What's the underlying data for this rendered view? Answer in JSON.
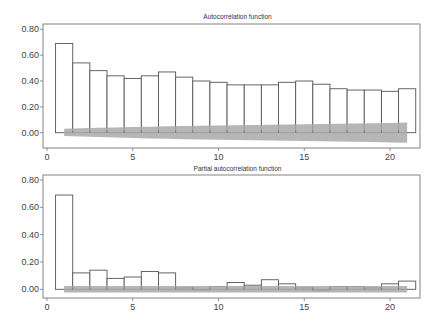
{
  "chart_data": [
    {
      "type": "bar",
      "title": "Autocorrelation function",
      "xlabel": "",
      "ylabel": "",
      "x": [
        1,
        2,
        3,
        4,
        5,
        6,
        7,
        8,
        9,
        10,
        11,
        12,
        13,
        14,
        15,
        16,
        17,
        18,
        19,
        20,
        21
      ],
      "values": [
        0.69,
        0.54,
        0.48,
        0.44,
        0.42,
        0.44,
        0.47,
        0.43,
        0.4,
        0.39,
        0.37,
        0.37,
        0.37,
        0.39,
        0.4,
        0.375,
        0.34,
        0.33,
        0.33,
        0.32,
        0.34,
        0.36
      ],
      "confidence_band": {
        "upper": [
          0.03,
          0.034,
          0.038,
          0.041,
          0.044,
          0.047,
          0.05,
          0.052,
          0.054,
          0.056,
          0.058,
          0.06,
          0.062,
          0.064,
          0.066,
          0.068,
          0.07,
          0.072,
          0.074,
          0.076,
          0.078
        ],
        "lower": [
          -0.025,
          -0.03,
          -0.034,
          -0.038,
          -0.041,
          -0.044,
          -0.047,
          -0.05,
          -0.052,
          -0.054,
          -0.056,
          -0.058,
          -0.06,
          -0.062,
          -0.064,
          -0.066,
          -0.068,
          -0.07,
          -0.072,
          -0.075,
          -0.078
        ]
      },
      "xticks": [
        "0",
        "5",
        "10",
        "15",
        "20"
      ],
      "xtick_values": [
        0,
        5,
        10,
        15,
        20
      ],
      "yticks": [
        "0.00",
        "0.20",
        "0.40",
        "0.60",
        "0.80"
      ],
      "ytick_values": [
        0,
        0.2,
        0.4,
        0.6,
        0.8
      ],
      "xlim": [
        -0.25,
        21.8
      ],
      "ylim": [
        -0.13,
        0.84
      ],
      "grid": false,
      "legend": null
    },
    {
      "type": "bar",
      "title": "Partial autocorrelation function",
      "xlabel": "",
      "ylabel": "",
      "x": [
        1,
        2,
        3,
        4,
        5,
        6,
        7,
        8,
        9,
        10,
        11,
        12,
        13,
        14,
        15,
        16,
        17,
        18,
        19,
        20,
        21
      ],
      "values": [
        0.69,
        0.12,
        0.14,
        0.08,
        0.09,
        0.13,
        0.12,
        0.01,
        0.0,
        0.02,
        0.05,
        0.03,
        0.07,
        0.04,
        0.01,
        -0.01,
        0.02,
        0.02,
        0.01,
        0.04,
        0.06
      ],
      "confidence_band": {
        "upper_const": 0.024,
        "lower_const": -0.024
      },
      "xticks": [
        "0",
        "5",
        "10",
        "15",
        "20"
      ],
      "xtick_values": [
        0,
        5,
        10,
        15,
        20
      ],
      "yticks": [
        "0.00",
        "0.20",
        "0.40",
        "0.60",
        "0.80"
      ],
      "ytick_values": [
        0,
        0.2,
        0.4,
        0.6,
        0.8
      ],
      "xlim": [
        -0.25,
        21.8
      ],
      "ylim": [
        -0.065,
        0.855
      ],
      "grid": false,
      "legend": null
    }
  ],
  "panels": [
    {
      "title": "Autocorrelation function"
    },
    {
      "title": "Partial autocorrelation function"
    }
  ],
  "colors": {
    "bar_fill": "#ffffff",
    "bar_stroke": "#555555",
    "band_fill": "#a9a9a9",
    "frame": "#777777",
    "text": "#444444"
  }
}
